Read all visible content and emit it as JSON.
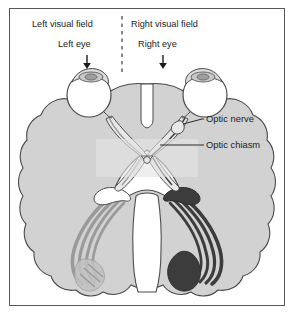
{
  "figure": {
    "border_color": "#56585a",
    "background_color": "#ffffff"
  },
  "labels": {
    "left_visual_field": "Left visual field",
    "right_visual_field": "Right visual field",
    "left_eye": "Left eye",
    "right_eye": "Right eye",
    "optic_nerve": "Optic nerve",
    "optic_chiasm": "Optic chiasm"
  },
  "icons": {
    "left_eye_arrow": "arrow-down-icon",
    "right_eye_arrow": "arrow-down-icon",
    "midline_divider": "dashed-vertical-line-icon"
  },
  "colors": {
    "brain_fill": "#d2d2d2",
    "brain_outline": "#4a4a4a",
    "eye_fill": "#ffffff",
    "dark_pathway": "#3c3c3c",
    "light_pathway": "#9a9a9a",
    "nerve_fill": "#e8e8e8",
    "highlight_box": "#e4e4e4",
    "text": "#1b1b1b",
    "leader_line": "#2a2a2a"
  },
  "anatomy": {
    "structures": [
      "left eye",
      "right eye",
      "optic nerve",
      "optic chiasm",
      "optic tract",
      "lateral geniculate nucleus",
      "optic radiation",
      "visual cortex",
      "brainstem"
    ],
    "note_dark_side": "right visual field pathway shown dark",
    "note_light_side": "left visual field pathway shown light"
  }
}
